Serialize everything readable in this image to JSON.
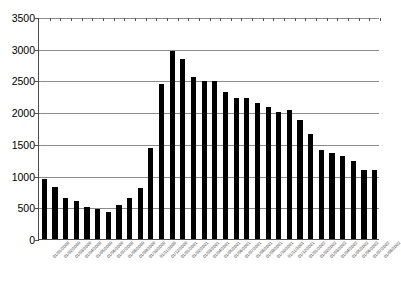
{
  "chart_data": {
    "type": "bar",
    "title": "",
    "subtitle": "",
    "xlabel": "",
    "ylabel": "",
    "ylim": [
      0,
      3500
    ],
    "ytick_step": 500,
    "yticks": [
      0,
      500,
      1000,
      1500,
      2000,
      2500,
      3000,
      3500
    ],
    "ytick_labels": [
      "0",
      "500",
      "1000",
      "1500",
      "2000",
      "2500",
      "3000",
      "3500"
    ],
    "grid": true,
    "grid_axis": "y",
    "legend": false,
    "legend_position": "none",
    "bar_color": "#000000",
    "axis_color": "#4d4d4d",
    "gridline_color": "#8c8c8c",
    "background_color": "#ffffff",
    "xtick_label_rotation": -45,
    "categories": [
      "01/01/2000",
      "01/02/2000",
      "01/03/2000",
      "01/04/2000",
      "01/05/2000",
      "01/06/2000",
      "01/07/2000",
      "01/08/2000",
      "01/09/2000",
      "01/10/2000",
      "01/11/2000",
      "01/12/2000",
      "01/01/2001",
      "01/02/2001",
      "01/03/2001",
      "01/04/2001",
      "01/05/2001",
      "01/06/2001",
      "01/07/2001",
      "01/08/2001",
      "01/09/2001",
      "01/10/2001",
      "01/11/2001",
      "01/12/2001",
      "01/01/2002",
      "01/02/2002",
      "01/03/2002",
      "01/04/2002",
      "01/05/2002",
      "01/06/2002",
      "01/07/2002",
      "01/08/2002"
    ],
    "values": [
      940,
      820,
      640,
      600,
      500,
      480,
      430,
      530,
      650,
      810,
      1440,
      2440,
      2960,
      2840,
      2550,
      2490,
      2490,
      2320,
      2230,
      2230,
      2140,
      2080,
      2010,
      2030,
      1870,
      1650,
      1400,
      1350,
      1310,
      1230,
      1090,
      1090
    ]
  }
}
